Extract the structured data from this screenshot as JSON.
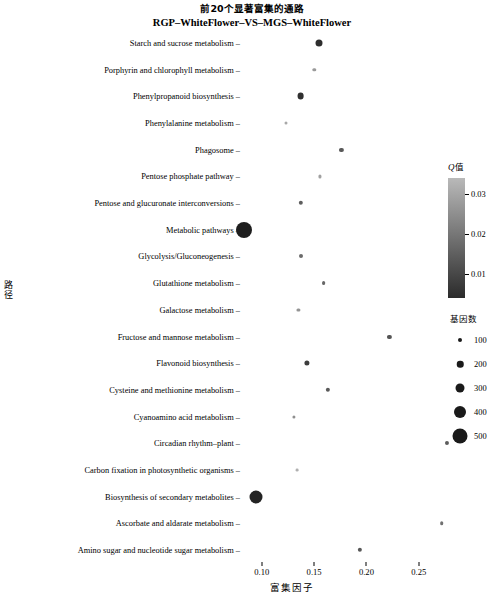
{
  "title": {
    "line1": "前20个显著富集的通路",
    "line2": "RGP–WhiteFlower–VS–MGS–WhiteFlower"
  },
  "axes": {
    "y_axis_title": "路径",
    "x_axis_title": "富集因子",
    "x_ticks": [
      "0.10",
      "0.15",
      "0.20",
      "0.25"
    ],
    "x_tick_values": [
      0.1,
      0.15,
      0.2,
      0.25
    ],
    "xlim": [
      0.082,
      0.278
    ]
  },
  "legend_color": {
    "title_q": "Q",
    "title_cn": "值",
    "ticks": [
      "0.03",
      "0.02",
      "0.01"
    ],
    "tick_values": [
      0.03,
      0.02,
      0.01
    ],
    "high_color": "#b9b9b9",
    "low_color": "#2b2b2b"
  },
  "legend_size": {
    "title": "基因数",
    "items": [
      {
        "label": "100",
        "diameter": 4
      },
      {
        "label": "200",
        "diameter": 6.5
      },
      {
        "label": "300",
        "diameter": 9
      },
      {
        "label": "400",
        "diameter": 12
      },
      {
        "label": "500",
        "diameter": 15
      }
    ]
  },
  "caption": "",
  "chart_data": {
    "type": "scatter",
    "title": "前20个显著富集的通路 RGP–WhiteFlower–VS–MGS–WhiteFlower",
    "xlabel": "富集因子",
    "ylabel": "路径",
    "grid": false,
    "legend_position": "right",
    "size_encoding": "基因数 (gene count)",
    "color_encoding": "Q值 (Q value)",
    "xlim": [
      0.082,
      0.278
    ],
    "points": [
      {
        "pathway": "Starch and sucrose metabolism",
        "x": 0.155,
        "gene_count": 215,
        "qvalue": 0.004,
        "diameter": 7.0,
        "color": "#2e2e2e"
      },
      {
        "pathway": "Porphyrin and chlorophyll metabolism",
        "x": 0.15,
        "gene_count": 95,
        "qvalue": 0.028,
        "diameter": 3.4,
        "color": "#9a9a9a"
      },
      {
        "pathway": "Phenylpropanoid biosynthesis",
        "x": 0.137,
        "gene_count": 205,
        "qvalue": 0.005,
        "diameter": 6.8,
        "color": "#303030"
      },
      {
        "pathway": "Phenylalanine metabolism",
        "x": 0.123,
        "gene_count": 80,
        "qvalue": 0.03,
        "diameter": 3.0,
        "color": "#a8a8a8"
      },
      {
        "pathway": "Phagosome",
        "x": 0.176,
        "gene_count": 120,
        "qvalue": 0.012,
        "diameter": 4.2,
        "color": "#595959"
      },
      {
        "pathway": "Pentose phosphate pathway",
        "x": 0.156,
        "gene_count": 85,
        "qvalue": 0.029,
        "diameter": 3.1,
        "color": "#a0a0a0"
      },
      {
        "pathway": "Pentose and glucuronate interconversions",
        "x": 0.137,
        "gene_count": 125,
        "qvalue": 0.013,
        "diameter": 4.4,
        "color": "#5e5e5e"
      },
      {
        "pathway": "Metabolic pathways",
        "x": 0.083,
        "gene_count": 520,
        "qvalue": 0.001,
        "diameter": 16.0,
        "color": "#1e1e1e"
      },
      {
        "pathway": "Glycolysis/Gluconeogenesis",
        "x": 0.137,
        "gene_count": 110,
        "qvalue": 0.016,
        "diameter": 4.0,
        "color": "#6b6b6b"
      },
      {
        "pathway": "Glutathione metabolism",
        "x": 0.159,
        "gene_count": 105,
        "qvalue": 0.015,
        "diameter": 3.8,
        "color": "#676767"
      },
      {
        "pathway": "Galactose metabolism",
        "x": 0.135,
        "gene_count": 90,
        "qvalue": 0.027,
        "diameter": 3.2,
        "color": "#949494"
      },
      {
        "pathway": "Fructose and mannose metabolism",
        "x": 0.222,
        "gene_count": 115,
        "qvalue": 0.011,
        "diameter": 4.2,
        "color": "#545454"
      },
      {
        "pathway": "Flavonoid biosynthesis",
        "x": 0.143,
        "gene_count": 150,
        "qvalue": 0.008,
        "diameter": 5.2,
        "color": "#3d3d3d"
      },
      {
        "pathway": "Cysteine and methionine metabolism",
        "x": 0.163,
        "gene_count": 118,
        "qvalue": 0.013,
        "diameter": 4.3,
        "color": "#5a5a5a"
      },
      {
        "pathway": "Cyanoamino acid metabolism",
        "x": 0.131,
        "gene_count": 88,
        "qvalue": 0.026,
        "diameter": 3.2,
        "color": "#8f8f8f"
      },
      {
        "pathway": "Circadian rhythm–plant",
        "x": 0.277,
        "gene_count": 112,
        "qvalue": 0.014,
        "diameter": 4.1,
        "color": "#5c5c5c"
      },
      {
        "pathway": "Carbon fixation in photosynthetic organisms",
        "x": 0.134,
        "gene_count": 78,
        "qvalue": 0.031,
        "diameter": 2.8,
        "color": "#b0b0b0"
      },
      {
        "pathway": "Biosynthesis of secondary metabolites",
        "x": 0.094,
        "gene_count": 430,
        "qvalue": 0.002,
        "diameter": 13.0,
        "color": "#232323"
      },
      {
        "pathway": "Ascorbate and aldarate metabolism",
        "x": 0.272,
        "gene_count": 100,
        "qvalue": 0.018,
        "diameter": 3.6,
        "color": "#717171"
      },
      {
        "pathway": "Amino sugar and nucleotide sugar metabolism",
        "x": 0.194,
        "gene_count": 122,
        "qvalue": 0.012,
        "diameter": 4.3,
        "color": "#575757"
      }
    ]
  }
}
